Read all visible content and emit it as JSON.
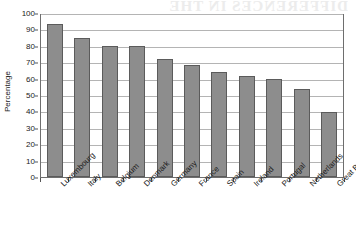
{
  "figure": {
    "bleed_through_text": "DIFFERENCES IN THE",
    "background_color": "#ffffff",
    "bar_fill_color": "#8d8d8d",
    "bar_border_color": "#5b5b5b",
    "gridline_color": "#b4b4b4",
    "frame_color": "#6e6e6e"
  },
  "chart_data": {
    "type": "bar",
    "title": "",
    "xlabel": "",
    "ylabel": "Percentage",
    "ylim": [
      0,
      100
    ],
    "ytick_step": 10,
    "yticks": [
      0,
      10,
      20,
      30,
      40,
      50,
      60,
      70,
      80,
      90,
      100
    ],
    "ytick_labels": [
      "0",
      "10",
      "20",
      "30",
      "40",
      "50",
      "60",
      "70",
      "80",
      "90",
      "100"
    ],
    "grid": "horizontal",
    "legend": "none",
    "orientation": "vertical",
    "categories": [
      "Luxembourg",
      "Italy",
      "Belgium",
      "Denmark",
      "Germany",
      "France",
      "Spain",
      "Ireland",
      "Portugal",
      "Netherlands",
      "Great Britain"
    ],
    "values": [
      93,
      85,
      80,
      80,
      72,
      68,
      64,
      61.5,
      59.5,
      53.5,
      39.5
    ]
  }
}
